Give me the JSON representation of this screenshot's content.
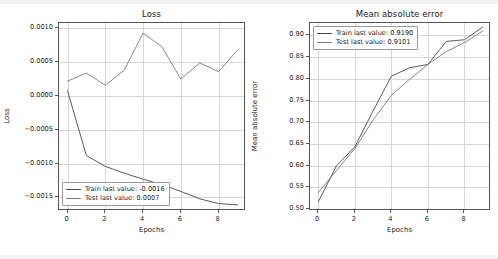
{
  "figure": {
    "background": "#ffffff",
    "band_color": "#f2f2f2",
    "train_color": "#4a4a4a",
    "test_color": "#7a7a7a",
    "grid_color": "#d7d7d7",
    "axis_color": "#555555"
  },
  "chart_data": [
    {
      "type": "line",
      "title": "Loss",
      "xlabel": "Epochs",
      "ylabel": "Loss",
      "x": [
        0,
        1,
        2,
        3,
        4,
        5,
        6,
        7,
        8,
        9
      ],
      "xlim": [
        -0.45,
        9.45
      ],
      "ylim": [
        -0.0017,
        0.00108
      ],
      "xticks": [
        0,
        2,
        4,
        6,
        8
      ],
      "xtick_labels": [
        "0",
        "2",
        "4",
        "6",
        "8"
      ],
      "yticks": [
        0.001,
        0.0005,
        0.0,
        -0.0005,
        -0.001,
        -0.0015
      ],
      "ytick_labels": [
        "0.0010",
        "0.0005",
        "0.0000",
        "−0.0005",
        "−0.0010",
        "−0.0015"
      ],
      "grid": true,
      "legend_position": "lower left",
      "series": [
        {
          "name": "Train last value: -0.0016",
          "short_name": "Train",
          "last_value": -0.0016,
          "color": "#4a4a4a",
          "values": [
            8e-05,
            -0.00088,
            -0.00104,
            -0.00114,
            -0.00123,
            -0.00131,
            -0.00141,
            -0.00152,
            -0.00159,
            -0.00161
          ]
        },
        {
          "name": "Test last value: 0.0007",
          "short_name": "Test",
          "last_value": 0.0007,
          "color": "#7a7a7a",
          "values": [
            0.00022,
            0.00034,
            0.00016,
            0.00038,
            0.00093,
            0.00073,
            0.00025,
            0.00049,
            0.00036,
            0.00068
          ]
        }
      ]
    },
    {
      "type": "line",
      "title": "Mean absolute error",
      "xlabel": "Epochs",
      "ylabel": "Mean absolute error",
      "x": [
        0,
        1,
        2,
        3,
        4,
        5,
        6,
        7,
        8,
        9
      ],
      "xlim": [
        -0.45,
        9.45
      ],
      "ylim": [
        0.4955,
        0.9285
      ],
      "xticks": [
        0,
        2,
        4,
        6,
        8
      ],
      "xtick_labels": [
        "0",
        "2",
        "4",
        "6",
        "8"
      ],
      "yticks": [
        0.5,
        0.55,
        0.6,
        0.65,
        0.7,
        0.75,
        0.8,
        0.85,
        0.9
      ],
      "ytick_labels": [
        "0.50",
        "0.55",
        "0.60",
        "0.65",
        "0.70",
        "0.75",
        "0.80",
        "0.85",
        "0.90"
      ],
      "grid": true,
      "legend_position": "upper left",
      "series": [
        {
          "name": "Train last value: 0.9190",
          "short_name": "Train",
          "last_value": 0.919,
          "color": "#4a4a4a",
          "values": [
            0.5165,
            0.5995,
            0.643,
            0.726,
            0.806,
            0.8255,
            0.833,
            0.886,
            0.89,
            0.919
          ]
        },
        {
          "name": "Test last value: 0.9101",
          "short_name": "Test",
          "last_value": 0.9101,
          "color": "#7a7a7a",
          "values": [
            0.538,
            0.589,
            0.639,
            0.705,
            0.762,
            0.799,
            0.833,
            0.8625,
            0.8835,
            0.9101
          ]
        }
      ]
    }
  ]
}
